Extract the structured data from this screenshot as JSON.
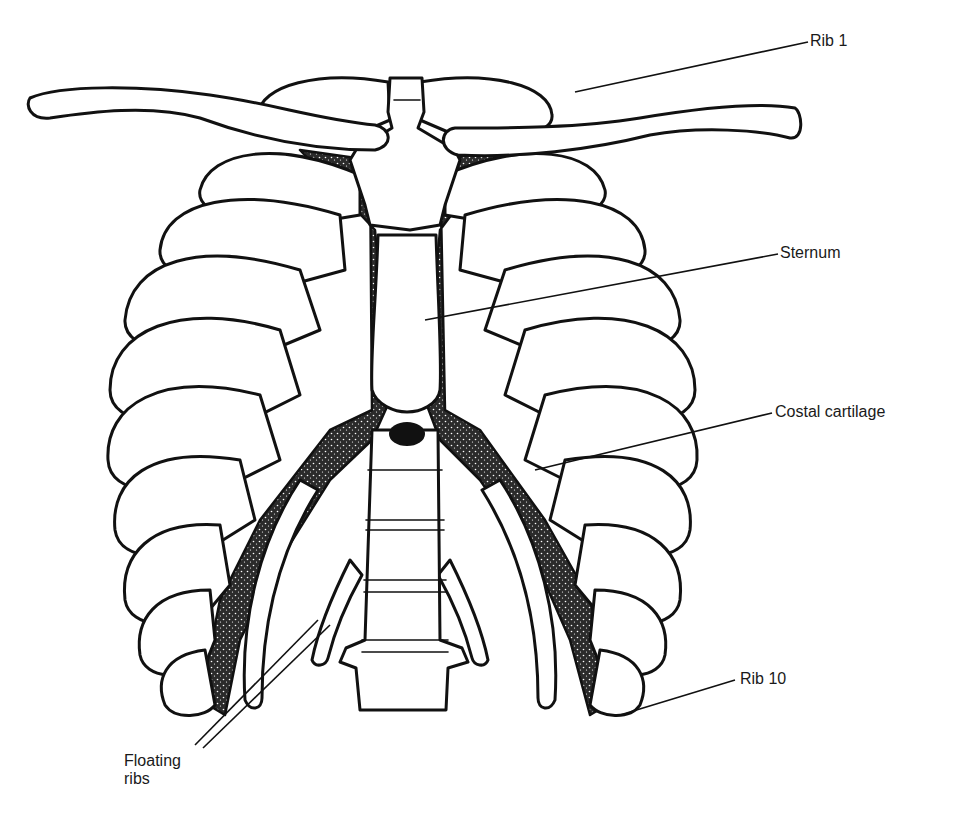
{
  "figure": {
    "colors": {
      "line": "#111111",
      "background": "#ffffff",
      "cartilage_fill": "#2a2a2a"
    }
  },
  "labels": {
    "rib_1": "Rib 1",
    "sternum": "Sternum",
    "costal_cartilage": "Costal cartilage",
    "rib_10": "Rib 10",
    "floating_ribs_line1": "Floating",
    "floating_ribs_line2": "ribs"
  }
}
